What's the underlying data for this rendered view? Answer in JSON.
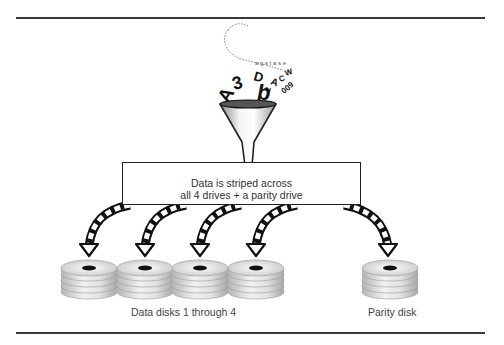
{
  "diagram": {
    "type": "RAID striping with parity illustration",
    "input_characters": [
      "A",
      "3",
      "b",
      "D",
      "A",
      "2",
      "C",
      "W",
      "0",
      "0",
      "9"
    ],
    "process_box": {
      "line1": "Data is striped across",
      "line2": "all 4 drives + a parity drive"
    },
    "data_disks": {
      "count": 4,
      "label": "Data disks 1 through 4"
    },
    "parity_disk": {
      "count": 1,
      "label": "Parity disk"
    },
    "icons": {
      "funnel": "funnel-icon",
      "arrow": "curved-arrow-icon",
      "disk_stack": "disk-stack-icon"
    },
    "colors": {
      "rule": "#3a3a3a",
      "text": "#333333",
      "disk_silver": "#d9d9d9",
      "disk_hub": "#111111"
    }
  }
}
